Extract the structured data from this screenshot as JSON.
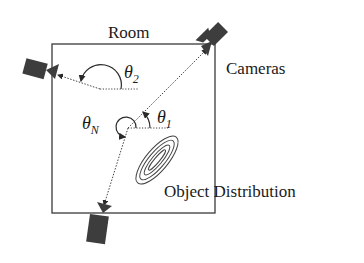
{
  "diagram": {
    "labels": {
      "room": "Room",
      "cameras": "Cameras",
      "object_distribution": "Object Distribution"
    },
    "angles": [
      {
        "symbol": "θ",
        "subscript": "1"
      },
      {
        "symbol": "θ",
        "subscript": "2"
      },
      {
        "symbol": "θ",
        "subscript": "N"
      }
    ],
    "colors": {
      "background": "#ffffff",
      "lines": "#3a3a3a",
      "camera": "#3d3d3d"
    }
  }
}
